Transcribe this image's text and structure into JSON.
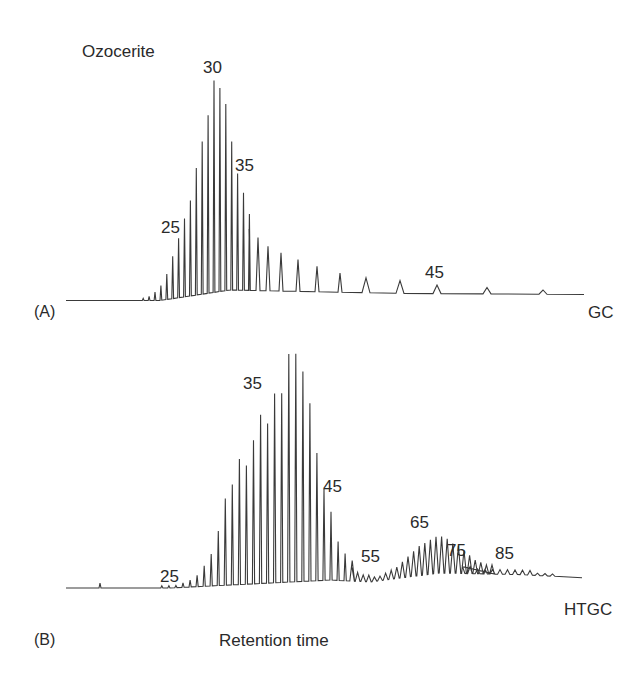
{
  "chart_data": [
    {
      "type": "line",
      "panel": "(A)",
      "title": "Ozocerite",
      "method_label": "GC",
      "xlabel": "",
      "ylabel": "",
      "grid": false,
      "annotations": [
        "25",
        "30",
        "35",
        "45"
      ],
      "description": "Gas chromatogram of ozocerite n-alkanes; carbon numbers annotated; maximum near C30",
      "carbon_numbers": [
        18,
        19,
        20,
        21,
        22,
        23,
        24,
        25,
        26,
        27,
        28,
        29,
        30,
        31,
        32,
        33,
        34,
        35,
        36,
        37,
        38,
        39,
        40,
        41,
        42,
        43,
        44,
        45,
        46,
        47,
        48
      ],
      "relative_heights": [
        1,
        2,
        4,
        7,
        12,
        20,
        28,
        37,
        45,
        60,
        72,
        84,
        100,
        96,
        88,
        70,
        55,
        46,
        36,
        29,
        25,
        21,
        18,
        15,
        12,
        9,
        7,
        6,
        4,
        3,
        2
      ]
    },
    {
      "type": "line",
      "panel": "(B)",
      "title": "",
      "method_label": "HTGC",
      "xlabel": "Retention time",
      "ylabel": "",
      "grid": false,
      "annotations": [
        "25",
        "35",
        "45",
        "55",
        "65",
        "75",
        "85"
      ],
      "description": "High-temperature GC of ozocerite; main n-alkane envelope peaking near C39-C40, second hump around C60-C68, elution extends beyond C85",
      "carbon_numbers": [
        22,
        23,
        24,
        25,
        26,
        27,
        28,
        29,
        30,
        31,
        32,
        33,
        34,
        35,
        36,
        37,
        38,
        39,
        40,
        41,
        42,
        43,
        44,
        45,
        46,
        47,
        48,
        49,
        50,
        51,
        52,
        53,
        54,
        55,
        56,
        57,
        58,
        59,
        60,
        61,
        62,
        63,
        64,
        65,
        66,
        67,
        68,
        69,
        70,
        71,
        72,
        73,
        74,
        75,
        76,
        77,
        78,
        79,
        80,
        81,
        82,
        83,
        84,
        85,
        86,
        87,
        88
      ],
      "relative_heights": [
        1,
        1,
        1,
        2,
        3,
        5,
        9,
        14,
        24,
        38,
        44,
        55,
        52,
        63,
        74,
        70,
        83,
        83,
        100,
        100,
        92,
        78,
        56,
        40,
        30,
        17,
        12,
        9,
        6,
        4,
        3,
        3,
        2,
        2,
        3,
        4,
        5,
        7,
        9,
        11,
        13,
        14,
        15,
        16,
        16,
        15,
        13,
        12,
        10,
        8,
        6,
        5,
        4,
        4,
        3,
        3,
        2,
        2,
        2,
        2,
        2,
        2,
        2,
        2,
        1,
        1,
        1
      ]
    }
  ],
  "labels": {
    "title": "Ozocerite",
    "panel_a": "(A)",
    "panel_b": "(B)",
    "gc": "GC",
    "htgc": "HTGC",
    "xlabel": "Retention time",
    "a_peaks": {
      "p25": "25",
      "p30": "30",
      "p35": "35",
      "p45": "45"
    },
    "b_peaks": {
      "p25": "25",
      "p35": "35",
      "p45": "45",
      "p55": "55",
      "p65": "65",
      "p75": "75",
      "p85": "85"
    }
  },
  "colors": {
    "trace": "#3a3a3a",
    "text": "#2a2a2a",
    "background": "#ffffff"
  }
}
